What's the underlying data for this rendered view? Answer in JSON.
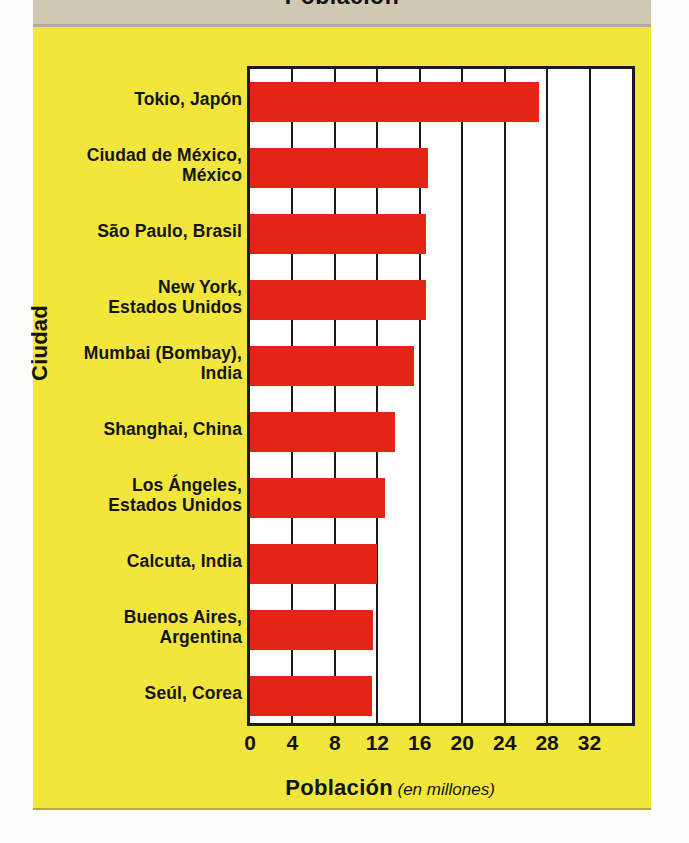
{
  "header": {
    "title_clipped": "Población"
  },
  "chart_data": {
    "type": "bar",
    "orientation": "horizontal",
    "title": "",
    "xlabel": "Población",
    "xlabel_note": "(en millones)",
    "ylabel": "Ciudad",
    "xlim": [
      0,
      36
    ],
    "xticks": [
      0,
      4,
      8,
      12,
      16,
      20,
      24,
      28,
      32
    ],
    "xtick_labels": [
      "0",
      "4",
      "8",
      "12",
      "16",
      "20",
      "24",
      "28",
      "32"
    ],
    "grid": "vertical",
    "legend": "none",
    "bar_color": "#e32517",
    "categories": [
      "Tokio, Japón",
      "Ciudad de México, México",
      "São Paulo, Brasil",
      "New York, Estados Unidos",
      "Mumbai (Bombay), India",
      "Shanghai, China",
      "Los Ángeles, Estados Unidos",
      "Calcuta, India",
      "Buenos Aires, Argentina",
      "Seúl, Corea"
    ],
    "values": [
      27.2,
      16.8,
      16.6,
      16.6,
      15.5,
      13.7,
      12.7,
      12.0,
      11.6,
      11.5
    ]
  },
  "category_label_lines": [
    [
      "Tokio, Japón"
    ],
    [
      "Ciudad de México,",
      "México"
    ],
    [
      "São Paulo, Brasil"
    ],
    [
      "New York,",
      "Estados Unidos"
    ],
    [
      "Mumbai (Bombay),",
      "India"
    ],
    [
      "Shanghai, China"
    ],
    [
      "Los Ángeles,",
      "Estados Unidos"
    ],
    [
      "Calcuta, India"
    ],
    [
      "Buenos Aires,",
      "Argentina"
    ],
    [
      "Seúl, Corea"
    ]
  ],
  "colors": {
    "background_card": "#f2e63c",
    "header_band": "#cdc9b2",
    "bar": "#e32517",
    "plot_background": "#ffffff",
    "frame": "#1a1a1a",
    "text": "#141414"
  }
}
